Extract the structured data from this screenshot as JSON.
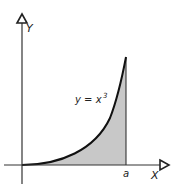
{
  "figure": {
    "y_axis_label": "Y",
    "x_axis_label": "X",
    "curve_label_lhs": "y = x",
    "curve_label_exp": "3",
    "upper_limit_label": "a",
    "colors": {
      "axis": "#333333",
      "curve": "#111111",
      "fill": "#c8c8c8",
      "background": "#ffffff"
    }
  }
}
